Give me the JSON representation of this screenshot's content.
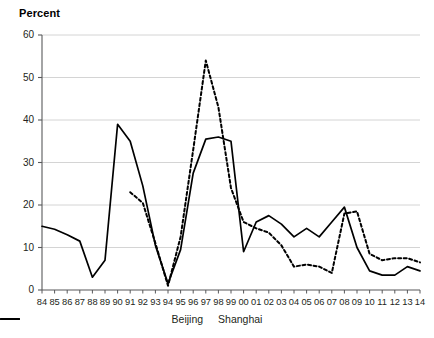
{
  "chart_data": {
    "type": "line",
    "title": "Percent",
    "xlabel": "",
    "ylabel": "Percent",
    "ylim": [
      0,
      60
    ],
    "yticks": [
      0,
      10,
      20,
      30,
      40,
      50,
      60
    ],
    "grid": true,
    "legend_position": "bottom-center",
    "categories": [
      "84",
      "85",
      "86",
      "87",
      "88",
      "89",
      "90",
      "91",
      "92",
      "93",
      "94",
      "95",
      "96",
      "97",
      "98",
      "99",
      "00",
      "01",
      "02",
      "03",
      "04",
      "05",
      "06",
      "07",
      "08",
      "09",
      "10",
      "11",
      "12",
      "13",
      "14"
    ],
    "series": [
      {
        "name": "Beijing",
        "style": "solid",
        "color": "#000000",
        "values": [
          15.0,
          14.3,
          13.0,
          11.5,
          3.0,
          7.0,
          39.0,
          35.0,
          24.5,
          10.5,
          1.5,
          9.5,
          27.5,
          35.5,
          36.0,
          35.0,
          9.0,
          16.0,
          17.5,
          15.5,
          12.5,
          14.5,
          12.5,
          16.0,
          19.5,
          10.0,
          4.5,
          3.5,
          3.5,
          5.5,
          4.5
        ]
      },
      {
        "name": "Shanghai",
        "style": "dashed",
        "color": "#000000",
        "values": [
          null,
          null,
          null,
          null,
          null,
          null,
          null,
          23.0,
          20.5,
          11.0,
          1.0,
          12.5,
          33.0,
          54.0,
          43.0,
          24.0,
          16.0,
          14.5,
          13.5,
          10.5,
          5.5,
          6.0,
          5.5,
          4.0,
          18.0,
          18.5,
          8.5,
          7.0,
          7.5,
          7.5,
          6.5
        ]
      }
    ]
  },
  "legend": {
    "items": [
      {
        "label": "Beijing",
        "style": "solid"
      },
      {
        "label": "Shanghai",
        "style": "dashed"
      }
    ]
  }
}
